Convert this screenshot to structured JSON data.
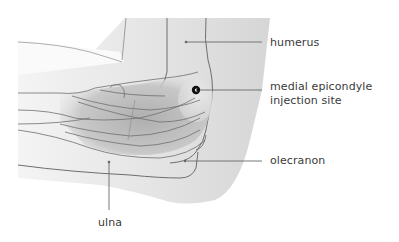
{
  "diagram": {
    "labels": {
      "humerus": "humerus",
      "medial_line1": "medial epicondyle",
      "medial_line2": "injection site",
      "olecranon": "olecranon",
      "ulna": "ulna"
    },
    "colors": {
      "background": "#ffffff",
      "skin_shade": "#dcdcdc",
      "muscle_shade": "#b8b8b8",
      "outline": "#6e6e6e",
      "leader_line": "#6a6a6a",
      "injection_dot": "#111111",
      "label_text": "#3a3a3a"
    }
  }
}
